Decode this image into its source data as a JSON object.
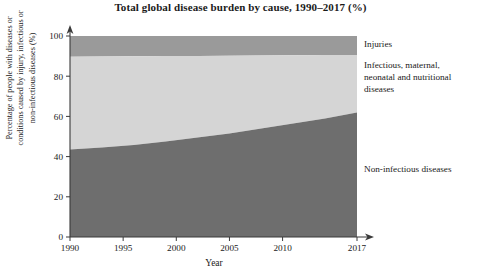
{
  "chart_data": {
    "type": "area",
    "title": "Total global disease burden by cause, 1990–2017 (%)",
    "xlabel": "Year",
    "ylabel": "Percentage of people with diseases or\nconditions caused by injury, infectious or\nnon-infectious diseases (%)",
    "xlim": [
      1990,
      2017
    ],
    "ylim": [
      0,
      100
    ],
    "grid": false,
    "stacked": true,
    "legend_position": "right",
    "xticks": [
      1990,
      1995,
      2000,
      2005,
      2010,
      2017
    ],
    "xtick_labels": [
      "1990",
      "1995",
      "2000",
      "2005",
      "2010",
      "2017"
    ],
    "yticks": [
      0,
      20,
      40,
      60,
      80,
      100
    ],
    "ytick_labels": [
      "0",
      "20",
      "40",
      "60",
      "80",
      "100"
    ],
    "x": [
      1990,
      1993,
      1996,
      1999,
      2002,
      2005,
      2008,
      2011,
      2014,
      2017
    ],
    "series": [
      {
        "name": "Non-infectious diseases",
        "color": "#6e6e6e",
        "values": [
          43.5,
          44.5,
          45.8,
          47.5,
          49.5,
          51.5,
          54.0,
          56.5,
          59.0,
          62.0
        ]
      },
      {
        "name": "Infectious, maternal, neonatal and nutritional diseases",
        "color": "#d5d5d5",
        "values": [
          46.2,
          45.3,
          44.1,
          42.5,
          40.6,
          38.7,
          36.3,
          33.9,
          31.5,
          28.6
        ]
      },
      {
        "name": "Injuries",
        "color": "#9a9a9a",
        "values": [
          10.3,
          10.2,
          10.1,
          10.0,
          9.9,
          9.8,
          9.7,
          9.6,
          9.5,
          9.4
        ]
      }
    ],
    "legend": [
      {
        "label": "Injuries",
        "color": "#9a9a9a"
      },
      {
        "label": "Infectious, maternal,\nneonatal and nutritional\ndiseases",
        "color": "#d5d5d5"
      },
      {
        "label": "Non-infectious diseases",
        "color": "#6e6e6e"
      }
    ]
  }
}
